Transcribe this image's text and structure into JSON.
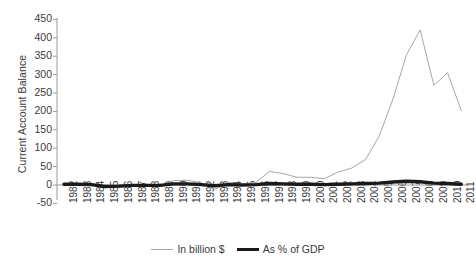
{
  "chart_data": {
    "type": "line",
    "title": "",
    "xlabel": "",
    "ylabel": "Current Account Balance",
    "ylim": [
      -50,
      450
    ],
    "ytick_step": 50,
    "grid": false,
    "legend_position": "bottom",
    "categories": [
      "1982",
      "1983",
      "1984",
      "1985",
      "1986",
      "1987",
      "1988",
      "1989",
      "1990",
      "1991",
      "1992",
      "1993",
      "1994",
      "1995",
      "1996",
      "1997",
      "1998",
      "1999",
      "2000",
      "2001",
      "2002",
      "2003",
      "2004",
      "2005",
      "2006",
      "2007",
      "2008",
      "2009",
      "2010",
      "2011"
    ],
    "series": [
      {
        "name": "In billion $",
        "color": "#a6a6a6",
        "width": 1,
        "values": [
          4,
          4,
          2,
          -5,
          -7,
          -3,
          -1,
          -1,
          12,
          13,
          6,
          -12,
          7,
          2,
          7,
          37,
          31,
          21,
          21,
          17,
          35,
          46,
          69,
          132,
          232,
          354,
          421,
          271,
          305,
          202
        ]
      },
      {
        "name": "As % of GDP",
        "color": "#1a1a1a",
        "width": 3.4,
        "values": [
          2,
          2,
          1,
          -4,
          -3,
          -1,
          -1,
          -1,
          3,
          3,
          1,
          -2,
          1,
          0,
          1,
          4,
          3,
          2,
          2,
          1,
          2,
          3,
          4,
          5,
          8,
          10,
          9,
          5,
          4,
          2
        ]
      }
    ]
  },
  "axes": {
    "y_ticks": [
      "450",
      "400",
      "350",
      "300",
      "250",
      "200",
      "150",
      "100",
      "50",
      "0",
      "-50"
    ],
    "y_title": "Current Account Balance"
  },
  "legend": {
    "items": [
      {
        "label": "In billion $",
        "style": "thin"
      },
      {
        "label": "As % of GDP",
        "style": "thick"
      }
    ]
  }
}
